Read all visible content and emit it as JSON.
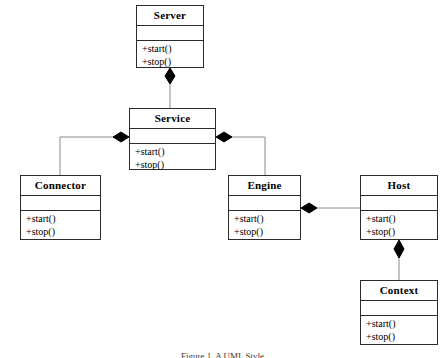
{
  "diagram": {
    "caption": "Figure 1. A UML Style",
    "notation": "UML composition (filled diamond at the whole end)",
    "stroke_color": "#2b2b2b",
    "line_color": "#8a8a8a",
    "diamond_color": "#000000",
    "background_color": "#ffffff",
    "text_color": "#000000"
  },
  "classes": [
    {
      "id": "server",
      "name": "Server",
      "attributes": [],
      "operations": [
        "+start()",
        "+stop()"
      ],
      "x": 136,
      "y": 5,
      "w": 68,
      "h": 63
    },
    {
      "id": "service",
      "name": "Service",
      "attributes": [],
      "operations": [
        "+start()",
        "+stop()"
      ],
      "x": 129,
      "y": 108,
      "w": 87,
      "h": 62
    },
    {
      "id": "connector",
      "name": "Connector",
      "attributes": [],
      "operations": [
        "+start()",
        "+stop()"
      ],
      "x": 20,
      "y": 175,
      "w": 81,
      "h": 65
    },
    {
      "id": "engine",
      "name": "Engine",
      "attributes": [],
      "operations": [
        "+start()",
        "+stop()"
      ],
      "x": 228,
      "y": 175,
      "w": 73,
      "h": 65
    },
    {
      "id": "host",
      "name": "Host",
      "attributes": [],
      "operations": [
        "+start()",
        "+stop()"
      ],
      "x": 360,
      "y": 175,
      "w": 78,
      "h": 65
    },
    {
      "id": "context",
      "name": "Context",
      "attributes": [],
      "operations": [
        "+start()",
        "+stop()"
      ],
      "x": 360,
      "y": 280,
      "w": 78,
      "h": 65
    }
  ],
  "relationships": [
    {
      "id": "server-service",
      "type": "composition",
      "whole": "Server",
      "part": "Service"
    },
    {
      "id": "service-connector",
      "type": "composition",
      "whole": "Service",
      "part": "Connector"
    },
    {
      "id": "service-engine",
      "type": "composition",
      "whole": "Service",
      "part": "Engine"
    },
    {
      "id": "engine-host",
      "type": "composition",
      "whole": "Engine",
      "part": "Host"
    },
    {
      "id": "host-context",
      "type": "composition",
      "whole": "Host",
      "part": "Context"
    }
  ]
}
